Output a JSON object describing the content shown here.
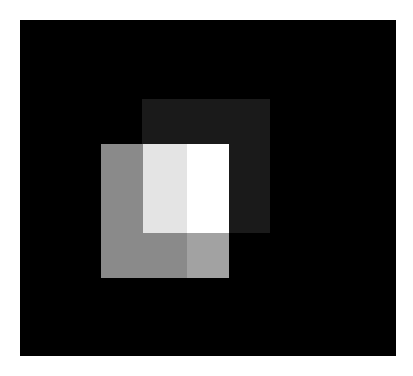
{
  "canvas": {
    "width": 413,
    "height": 376,
    "background": "#ffffff"
  },
  "shapes": [
    {
      "name": "outer-black-square",
      "x": 20,
      "y": 20,
      "w": 376,
      "h": 336,
      "color": "#000000"
    },
    {
      "name": "dark-gray-square",
      "x": 142,
      "y": 99,
      "w": 128,
      "h": 134,
      "color": "#1a1a1a"
    },
    {
      "name": "medium-gray-square",
      "x": 101,
      "y": 144,
      "w": 128,
      "h": 134,
      "color": "#8a8a8a"
    },
    {
      "name": "gray-overlap-lower-right",
      "x": 187,
      "y": 233,
      "w": 42,
      "h": 45,
      "color": "#a2a2a2"
    },
    {
      "name": "light-gray-overlap",
      "x": 143,
      "y": 144,
      "w": 44,
      "h": 89,
      "color": "#e4e4e4"
    },
    {
      "name": "white-overlap",
      "x": 187,
      "y": 144,
      "w": 42,
      "h": 89,
      "color": "#ffffff"
    }
  ]
}
